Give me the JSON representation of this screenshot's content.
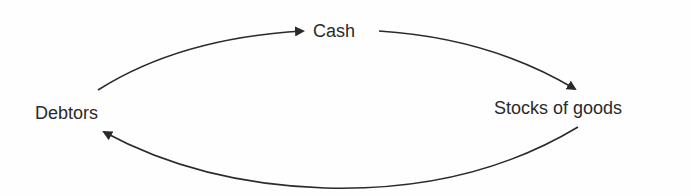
{
  "diagram": {
    "type": "cycle",
    "nodes": [
      {
        "id": "cash",
        "label": "Cash"
      },
      {
        "id": "stocks",
        "label": "Stocks of goods"
      },
      {
        "id": "debtors",
        "label": "Debtors"
      }
    ],
    "edges": [
      {
        "from": "debtors",
        "to": "cash",
        "shape": "curved-arrow"
      },
      {
        "from": "cash",
        "to": "stocks",
        "shape": "curved-arrow"
      },
      {
        "from": "stocks",
        "to": "debtors",
        "shape": "curved-arrow"
      }
    ],
    "colors": {
      "line": "#2a2a2a",
      "text": "#2a2a2a",
      "background": "#fefefe"
    }
  }
}
